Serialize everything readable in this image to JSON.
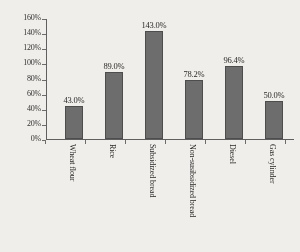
{
  "chart_data": {
    "type": "bar",
    "title": "",
    "xlabel": "",
    "ylabel": "",
    "categories": [
      "Wheat flour",
      "Rice",
      "Subsidized bread",
      "Non-susibsidized bread",
      "Diesel",
      "Gas cylinder"
    ],
    "values": [
      43.0,
      89.0,
      143.0,
      78.2,
      96.4,
      50.0
    ],
    "value_labels": [
      "43.0%",
      "89.0%",
      "143.0%",
      "78.2%",
      "96.4%",
      "50.0%"
    ],
    "ylim": [
      0,
      160
    ],
    "ytick_values": [
      0,
      20,
      40,
      60,
      80,
      100,
      120,
      140,
      160
    ],
    "ytick_labels": [
      "0%",
      "20%",
      "40%",
      "60%",
      "80%",
      "100%",
      "120%",
      "140%",
      "160%"
    ],
    "grid": false,
    "legend": false,
    "bar_color": "#6b6b6b",
    "bar_outline_color": "#4a4a4a",
    "axis_color": "#5d5d5d",
    "background_color": "#f2f0ec",
    "text_color": "#1f1f1f"
  }
}
